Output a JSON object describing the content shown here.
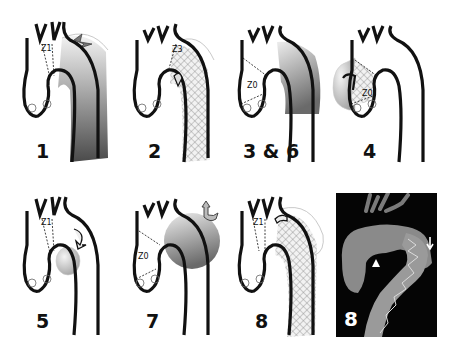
{
  "figure": {
    "panels": [
      {
        "id": "1",
        "label": "1",
        "zone": "Z1",
        "treatment": "gradient-graft-with-entry-tear"
      },
      {
        "id": "2",
        "label": "2",
        "zone": "Z3",
        "treatment": "stent-graft-hatched"
      },
      {
        "id": "3-6",
        "label": "3 & 6",
        "zone": "Z0",
        "treatment": "aneurysm-gradient"
      },
      {
        "id": "4",
        "label": "4",
        "zone": "Z0",
        "treatment": "ascending-aneurysm-with-leak-arrow"
      },
      {
        "id": "5",
        "label": "5",
        "zone": "Z1",
        "treatment": "saccular-aneurysm-with-arrow"
      },
      {
        "id": "7",
        "label": "7",
        "zone": "Z0",
        "treatment": "arch-aneurysm-with-branch-arrow"
      },
      {
        "id": "8",
        "label": "8",
        "zone": "Z1",
        "treatment": "stent-graft-hatched-with-branch"
      },
      {
        "id": "8-ct",
        "label": "8",
        "treatment": "ct-3d-reconstruction",
        "markers": [
          "arrowhead",
          "arrow"
        ]
      }
    ]
  },
  "colors": {
    "outline": "#111111",
    "graft_dark": "#555555",
    "graft_light": "#e8e8e8",
    "hatch": "#9a9a9a",
    "ct_bg": "#050505",
    "ct_tissue": "#8a8a8a"
  }
}
